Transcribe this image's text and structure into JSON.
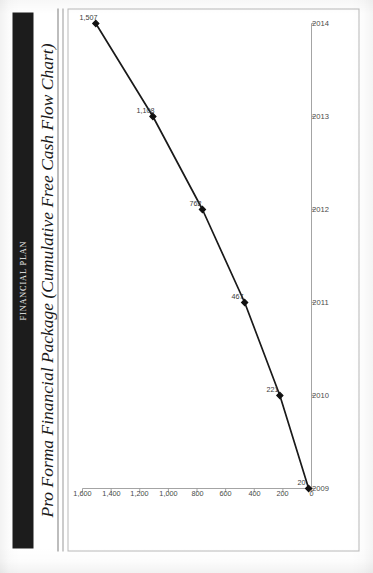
{
  "document": {
    "header_band_label": "FINANCIAL PLAN",
    "title": "Pro Forma Financial Package (Cumulative Free Cash Flow Chart)"
  },
  "colors": {
    "header_band_bg": "#1c1c1c",
    "header_band_text": "#f2f2f2",
    "series_line": "#1a1a1a",
    "marker": "#111111",
    "axis": "#9a9a9a",
    "frame_border": "#b9b9b9",
    "tick_label": "#4a4a4a"
  },
  "chart_data": {
    "type": "line",
    "title": "Pro Forma Financial Package (Cumulative Free Cash Flow Chart)",
    "xlabel": "",
    "ylabel": "",
    "categories": [
      "2009",
      "2010",
      "2011",
      "2012",
      "2013",
      "2014"
    ],
    "values": [
      20,
      221,
      467,
      762,
      1108,
      1507
    ],
    "point_labels": [
      "20",
      "221",
      "467",
      "762",
      "1,108",
      "1,507"
    ],
    "ylim": [
      0,
      1600
    ],
    "ytick_values": [
      0,
      200,
      400,
      600,
      800,
      1000,
      1200,
      1400,
      1600
    ],
    "ytick_labels": [
      "0",
      "200",
      "400",
      "600",
      "800",
      "1,000",
      "1,200",
      "1,400",
      "1,600"
    ],
    "xtick_labels": [
      "2009",
      "2010",
      "2011",
      "2012",
      "2013",
      "2014"
    ],
    "grid": false,
    "legend": false,
    "markers": "filled-diamond",
    "series": [
      {
        "name": "Cumulative Free Cash Flow",
        "values": [
          20,
          221,
          467,
          762,
          1108,
          1507
        ]
      }
    ]
  }
}
